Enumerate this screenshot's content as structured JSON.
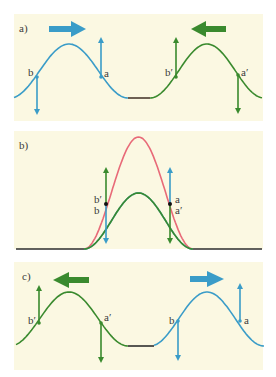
{
  "colors": {
    "background": "#ffffff",
    "panel": "#fbf8e2",
    "blue": "#3a9cc8",
    "green": "#3a8a2e",
    "red": "#e86a78",
    "baseline": "#3a3a3a",
    "point": "#111111"
  },
  "panels": [
    {
      "id": "a",
      "label": "a)",
      "description": "Two pulses approaching each other: blue pulse moving right, green pulse moving left",
      "pulses": [
        {
          "color": "blue",
          "direction": "right",
          "points": [
            {
              "name": "b",
              "label": "b",
              "velocity": "down"
            },
            {
              "name": "a",
              "label": "a",
              "velocity": "up"
            }
          ]
        },
        {
          "color": "green",
          "direction": "left",
          "points": [
            {
              "name": "b-prime",
              "label": "b′",
              "velocity": "up"
            },
            {
              "name": "a-prime",
              "label": "a′",
              "velocity": "down"
            }
          ]
        }
      ]
    },
    {
      "id": "b",
      "label": "b)",
      "description": "Pulses overlapping: superposition (red) of blue and green pulses",
      "labels": {
        "left_top": "b′",
        "left_bottom": "b",
        "right_top": "a",
        "right_bottom": "a′"
      }
    },
    {
      "id": "c",
      "label": "c)",
      "description": "Pulses after passing through each other: green pulse moving left, blue pulse moving right",
      "pulses": [
        {
          "color": "green",
          "direction": "left",
          "points": [
            {
              "name": "b-prime",
              "label": "b′",
              "velocity": "up"
            },
            {
              "name": "a-prime",
              "label": "a′",
              "velocity": "down"
            }
          ]
        },
        {
          "color": "blue",
          "direction": "right",
          "points": [
            {
              "name": "b",
              "label": "b",
              "velocity": "down"
            },
            {
              "name": "a",
              "label": "a",
              "velocity": "up"
            }
          ]
        }
      ]
    }
  ]
}
